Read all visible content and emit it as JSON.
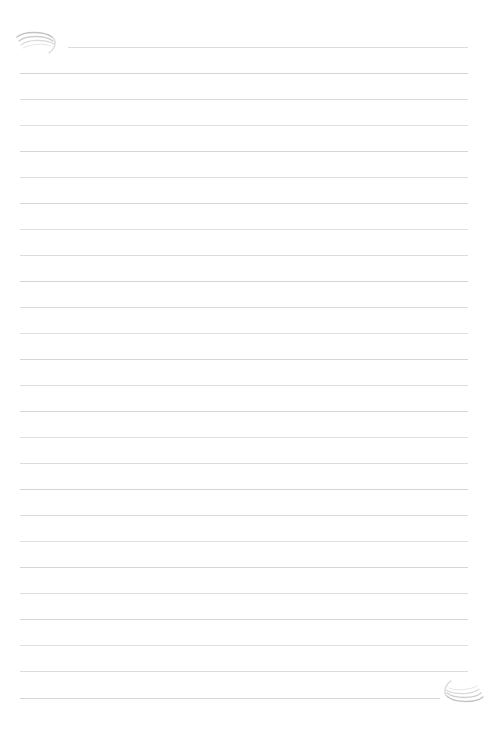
{
  "page": {
    "kind": "blank-ruled-notepaper",
    "width": 490,
    "height": 733,
    "background_color": "#ffffff",
    "text_content": "",
    "visible_text": []
  },
  "ruling": {
    "line_color": "#d9d9d9",
    "line_thickness": 1,
    "line_spacing": 26,
    "first_line_y": 47,
    "last_line_y": 698,
    "left_margin_x": 20,
    "right_margin_x": 468,
    "count": 26,
    "lines": [
      {
        "y": 47,
        "x1": 68,
        "x2": 468,
        "tone": "tone-a"
      },
      {
        "y": 73,
        "x1": 20,
        "x2": 468,
        "tone": "tone-b"
      },
      {
        "y": 99,
        "x1": 20,
        "x2": 468,
        "tone": "tone-a"
      },
      {
        "y": 125,
        "x1": 20,
        "x2": 468,
        "tone": "tone-c"
      },
      {
        "y": 151,
        "x1": 20,
        "x2": 468,
        "tone": "tone-b"
      },
      {
        "y": 177,
        "x1": 20,
        "x2": 468,
        "tone": "tone-a"
      },
      {
        "y": 203,
        "x1": 20,
        "x2": 468,
        "tone": "tone-b"
      },
      {
        "y": 229,
        "x1": 20,
        "x2": 468,
        "tone": "tone-c"
      },
      {
        "y": 255,
        "x1": 20,
        "x2": 468,
        "tone": "tone-a"
      },
      {
        "y": 281,
        "x1": 20,
        "x2": 468,
        "tone": "tone-b"
      },
      {
        "y": 307,
        "x1": 20,
        "x2": 468,
        "tone": "tone-a"
      },
      {
        "y": 333,
        "x1": 20,
        "x2": 468,
        "tone": "tone-c"
      },
      {
        "y": 359,
        "x1": 20,
        "x2": 468,
        "tone": "tone-b"
      },
      {
        "y": 385,
        "x1": 20,
        "x2": 468,
        "tone": "tone-a"
      },
      {
        "y": 411,
        "x1": 20,
        "x2": 468,
        "tone": "tone-b"
      },
      {
        "y": 437,
        "x1": 20,
        "x2": 468,
        "tone": "tone-c"
      },
      {
        "y": 463,
        "x1": 20,
        "x2": 468,
        "tone": "tone-a"
      },
      {
        "y": 489,
        "x1": 20,
        "x2": 468,
        "tone": "tone-b"
      },
      {
        "y": 515,
        "x1": 20,
        "x2": 468,
        "tone": "tone-a"
      },
      {
        "y": 541,
        "x1": 20,
        "x2": 468,
        "tone": "tone-c"
      },
      {
        "y": 567,
        "x1": 20,
        "x2": 468,
        "tone": "tone-b"
      },
      {
        "y": 593,
        "x1": 20,
        "x2": 468,
        "tone": "tone-a"
      },
      {
        "y": 619,
        "x1": 20,
        "x2": 468,
        "tone": "tone-b"
      },
      {
        "y": 645,
        "x1": 20,
        "x2": 468,
        "tone": "tone-c"
      },
      {
        "y": 671,
        "x1": 20,
        "x2": 468,
        "tone": "tone-a"
      },
      {
        "y": 698,
        "x1": 20,
        "x2": 440,
        "tone": "tone-b"
      }
    ]
  },
  "ornaments": {
    "stroke_color": "#b9b9b9",
    "top_left": {
      "name": "swirl-flourish",
      "description": "faint nested-curve swirl with descending tail",
      "x": 14,
      "y": 28,
      "width": 50,
      "height": 28
    },
    "bottom_right": {
      "name": "swirl-flourish",
      "description": "mirrored (180-degree rotated) nested-curve swirl",
      "x": 436,
      "y": 678,
      "width": 50,
      "height": 28
    }
  }
}
